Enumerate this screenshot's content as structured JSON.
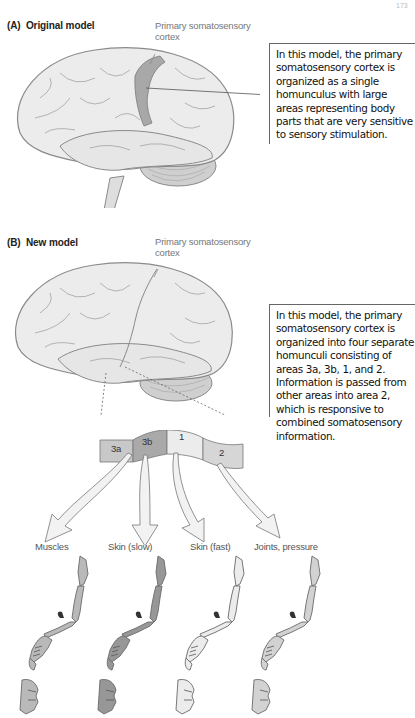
{
  "page_number": "173",
  "panel_a": {
    "label": "(A)  Original model",
    "callout": "Primary somatosensory cortex",
    "callout_line1": "Primary somatosensory",
    "callout_line2": "cortex",
    "description": "In this model, the primary somatosensory cortex is organized as a single homunculus with large areas representing body parts that are very sensitive to sensory stimulation."
  },
  "panel_b": {
    "label": "(B)  New model",
    "callout": "Primary somatosensory cortex",
    "callout_line1": "Primary somatosensory",
    "callout_line2": "cortex",
    "description": "In this model, the primary somatosensory cortex is organized into four separate homunculi consisting of areas 3a, 3b, 1, and 2. Information is passed from other areas into area 2, which is responsive to combined somatosensory information.",
    "strip_areas": [
      {
        "label": "3a",
        "color": "#c8c8c8"
      },
      {
        "label": "3b",
        "color": "#a9a9a9"
      },
      {
        "label": "1",
        "color": "#ececec"
      },
      {
        "label": "2",
        "color": "#d6d6d6"
      }
    ],
    "homunculi": [
      {
        "label": "Muscles",
        "fill": "#b9b9b9"
      },
      {
        "label": "Skin (slow)",
        "fill": "#979797"
      },
      {
        "label": "Skin (fast)",
        "fill": "#ececec"
      },
      {
        "label": "Joints, pressure",
        "fill": "#d2d2d2"
      }
    ]
  },
  "colors": {
    "brain_fill": "#e8e8e8",
    "brain_stroke": "#8a8a8a",
    "cortex_highlight": "#a8a8a8",
    "rule": "#666666"
  }
}
